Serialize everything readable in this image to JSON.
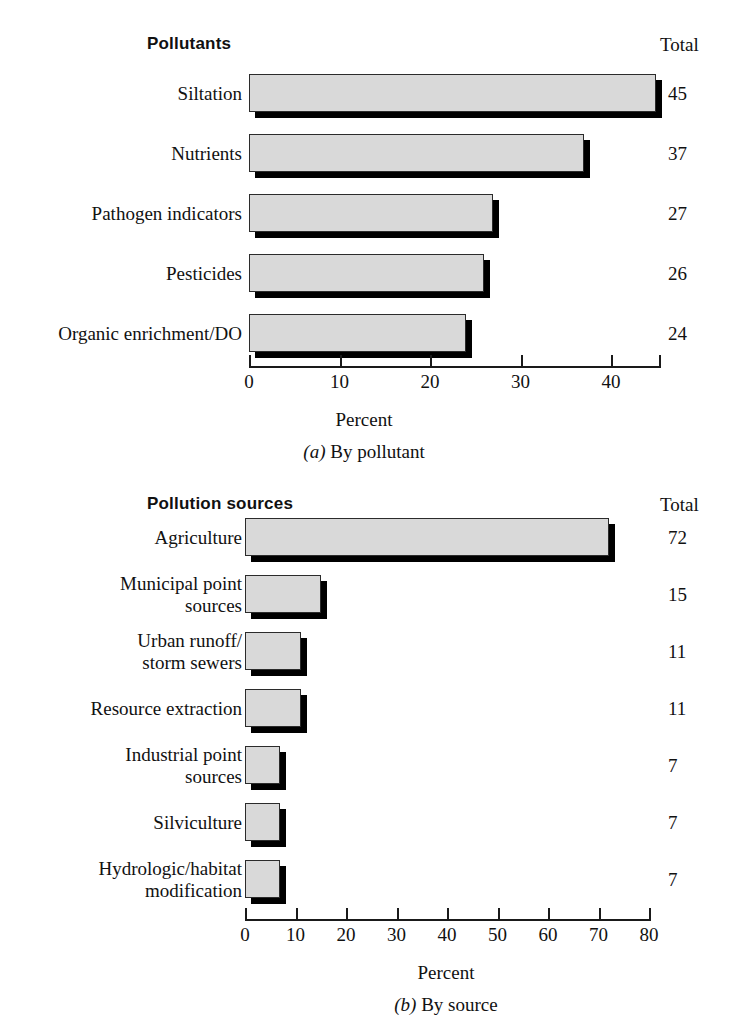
{
  "chart_data": [
    {
      "type": "bar",
      "orientation": "horizontal",
      "title": "Pollutants",
      "total_header": "Total",
      "categories": [
        "Siltation",
        "Nutrients",
        "Pathogen indicators",
        "Pesticides",
        "Organic enrichment/DO"
      ],
      "values": [
        45,
        37,
        27,
        26,
        24
      ],
      "totals": [
        "45",
        "37",
        "27",
        "26",
        "24"
      ],
      "xlabel": "Percent",
      "ylabel": "",
      "xlim": [
        0,
        45.5
      ],
      "xticks": [
        0,
        10,
        20,
        30,
        40
      ],
      "xticklabels": [
        "0",
        "10",
        "20",
        "30",
        "40"
      ],
      "grid": false,
      "caption_prefix": "(a)",
      "caption_text": " By pollutant",
      "bar_fill": "#d9d9d9",
      "bar_edge": "#2b2b2b",
      "shadow_color": "#000000"
    },
    {
      "type": "bar",
      "orientation": "horizontal",
      "title": "Pollution sources",
      "total_header": "Total",
      "categories": [
        "Agriculture",
        "Municipal point\nsources",
        "Urban runoff/\nstorm sewers",
        "Resource extraction",
        "Industrial point\nsources",
        "Silviculture",
        "Hydrologic/habitat\nmodification"
      ],
      "values": [
        72,
        15,
        11,
        11,
        7,
        7,
        7
      ],
      "totals": [
        "72",
        "15",
        "11",
        "11",
        "7",
        "7",
        "7"
      ],
      "xlabel": "Percent",
      "ylabel": "",
      "xlim": [
        0,
        80
      ],
      "xticks": [
        0,
        10,
        20,
        30,
        40,
        50,
        60,
        70,
        80
      ],
      "xticklabels": [
        "0",
        "10",
        "20",
        "30",
        "40",
        "50",
        "60",
        "70",
        "80"
      ],
      "grid": false,
      "caption_prefix": "(b)",
      "caption_text": " By source",
      "bar_fill": "#d9d9d9",
      "bar_edge": "#2b2b2b",
      "shadow_color": "#000000"
    }
  ]
}
